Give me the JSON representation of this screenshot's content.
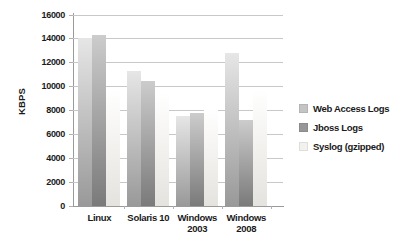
{
  "chart_data": {
    "type": "bar",
    "title": "",
    "xlabel": "",
    "ylabel": "KBPS",
    "ylim": [
      0,
      16000
    ],
    "yticks": [
      0,
      2000,
      4000,
      6000,
      8000,
      10000,
      12000,
      14000,
      16000
    ],
    "grid": true,
    "legend_position": "right",
    "categories": [
      "Linux",
      "Solaris 10",
      "Windows 2003",
      "Windows 2008"
    ],
    "series": [
      {
        "name": "Web Access Logs",
        "values": [
          14100,
          11300,
          7500,
          12800
        ],
        "color_top": "#e6e6e6",
        "color_bottom": "#999999",
        "legend_swatch": "#c4c4c4"
      },
      {
        "name": "Jboss Logs",
        "values": [
          14300,
          10500,
          7800,
          7200
        ],
        "color_top": "#cccccc",
        "color_bottom": "#7a7a7a",
        "legend_swatch": "#979797"
      },
      {
        "name": "Syslog (gzipped)",
        "values": [
          9800,
          9500,
          8100,
          9800
        ],
        "color_top": "#ffffff",
        "color_bottom": "#e5e3de",
        "legend_swatch": "#f3f1ed"
      }
    ]
  }
}
